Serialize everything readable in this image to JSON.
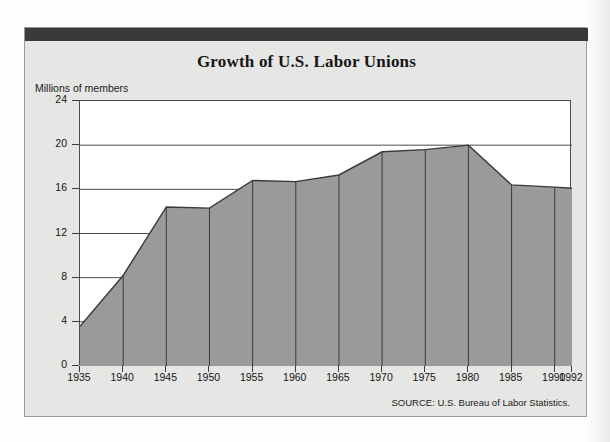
{
  "figure": {
    "background": "#fdfdfd",
    "card_background": "#e6e6e4",
    "header_bar_color": "#3a3a3a",
    "area_fill_color": "#9a9a9a",
    "line_color": "#3a3a3a"
  },
  "chart_data": {
    "type": "area",
    "title": "Growth of U.S. Labor Unions",
    "xlabel": "",
    "ylabel": "Millions of members",
    "ylim": [
      0,
      24
    ],
    "xlim": [
      1935,
      1992
    ],
    "grid": true,
    "legend": "none",
    "ytick_labels": [
      "24",
      "20",
      "16",
      "12",
      "8",
      "4",
      "0"
    ],
    "ytick_values": [
      24,
      20,
      16,
      12,
      8,
      4,
      0
    ],
    "xtick_labels": [
      "1935",
      "1940",
      "1945",
      "1950",
      "1955",
      "1960",
      "1965",
      "1970",
      "1975",
      "1980",
      "1985",
      "1990",
      "1992"
    ],
    "x": [
      1935,
      1940,
      1945,
      1950,
      1955,
      1960,
      1965,
      1970,
      1975,
      1980,
      1985,
      1990,
      1992
    ],
    "categories": [
      "1935",
      "1940",
      "1945",
      "1950",
      "1955",
      "1960",
      "1965",
      "1970",
      "1975",
      "1980",
      "1985",
      "1990",
      "1992"
    ],
    "values": [
      3.6,
      8.2,
      14.4,
      14.3,
      16.8,
      16.7,
      17.3,
      19.4,
      19.6,
      20.0,
      16.4,
      16.2,
      16.1
    ],
    "series": [
      {
        "name": "U.S. labor union membership",
        "values": [
          3.6,
          8.2,
          14.4,
          14.3,
          16.8,
          16.7,
          17.3,
          19.4,
          19.6,
          20.0,
          16.4,
          16.2,
          16.1
        ]
      }
    ],
    "annotations": [
      "SOURCE: U.S. Bureau of Labor Statistics."
    ]
  },
  "source": {
    "note": "SOURCE: U.S. Bureau of Labor Statistics."
  }
}
